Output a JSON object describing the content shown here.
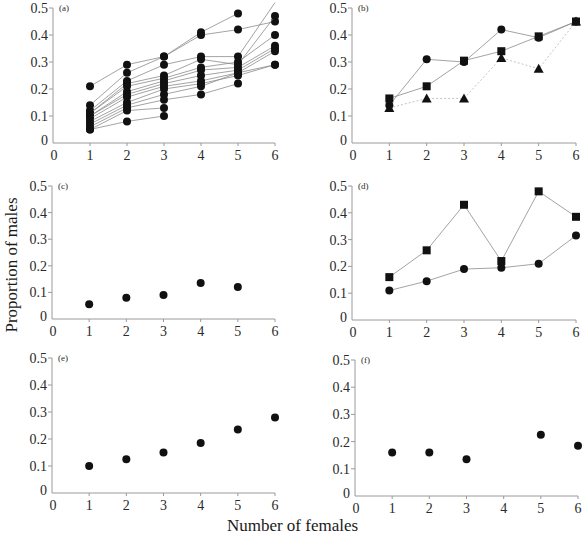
{
  "figure": {
    "ylabel": "Proportion of males",
    "xlabel": "Number of females"
  },
  "chart_data": [
    {
      "panel": "(a)",
      "type": "line",
      "xlabel": "Number of females",
      "ylabel": "Proportion of males",
      "xlim": [
        0,
        6
      ],
      "ylim": [
        0,
        0.5
      ],
      "xticks": [
        0,
        1,
        2,
        3,
        4,
        5,
        6
      ],
      "yticks": [
        0,
        0.1,
        0.2,
        0.3,
        0.4,
        0.5
      ],
      "grid": false,
      "marker": "circle",
      "x": [
        1,
        2,
        3,
        4,
        5,
        6
      ],
      "series": [
        {
          "name": "group 1",
          "values": [
            0.21,
            0.29,
            0.32,
            0.41,
            0.48,
            null
          ]
        },
        {
          "name": "group 2",
          "values": [
            0.14,
            0.26,
            0.32,
            0.4,
            0.42,
            0.45
          ]
        },
        {
          "name": "group 3",
          "values": [
            0.12,
            0.23,
            0.29,
            0.32,
            0.32,
            0.52
          ]
        },
        {
          "name": "group 4",
          "values": [
            0.11,
            0.22,
            0.25,
            0.31,
            0.29,
            0.47
          ]
        },
        {
          "name": "group 5",
          "values": [
            0.11,
            0.21,
            0.24,
            0.28,
            0.3,
            0.4
          ]
        },
        {
          "name": "group 6",
          "values": [
            0.1,
            0.19,
            0.23,
            0.27,
            0.28,
            0.36
          ]
        },
        {
          "name": "group 7",
          "values": [
            0.1,
            0.18,
            0.22,
            0.25,
            0.27,
            0.35
          ]
        },
        {
          "name": "group 8",
          "values": [
            0.09,
            0.17,
            0.21,
            0.23,
            0.26,
            0.34
          ]
        },
        {
          "name": "group 9",
          "values": [
            0.08,
            0.15,
            0.2,
            0.22,
            0.25,
            0.29
          ]
        },
        {
          "name": "group 10",
          "values": [
            0.07,
            0.14,
            0.18,
            0.21,
            0.26,
            0.29
          ]
        },
        {
          "name": "group 11",
          "values": [
            0.06,
            0.13,
            0.16,
            0.18,
            0.22,
            null
          ]
        },
        {
          "name": "group 12",
          "values": [
            0.05,
            0.12,
            0.13,
            null,
            null,
            null
          ]
        },
        {
          "name": "group 13",
          "values": [
            0.05,
            0.08,
            0.1,
            null,
            null,
            null
          ]
        }
      ]
    },
    {
      "panel": "(b)",
      "type": "line",
      "xlim": [
        0,
        6
      ],
      "ylim": [
        0,
        0.5
      ],
      "xticks": [
        0,
        1,
        2,
        3,
        4,
        5,
        6
      ],
      "yticks": [
        0,
        0.1,
        0.2,
        0.3,
        0.4,
        0.5
      ],
      "grid": false,
      "x": [
        1,
        2,
        3,
        4,
        5,
        6
      ],
      "series": [
        {
          "name": "circles",
          "marker": "circle",
          "line": "solid",
          "values": [
            0.14,
            0.31,
            0.3,
            0.42,
            0.39,
            0.45
          ]
        },
        {
          "name": "squares",
          "marker": "square",
          "line": "solid",
          "values": [
            0.165,
            0.21,
            0.305,
            0.34,
            0.395,
            0.45
          ]
        },
        {
          "name": "triangles",
          "marker": "triangle",
          "line": "dotted",
          "values": [
            0.13,
            0.165,
            0.165,
            0.315,
            0.275,
            0.45
          ]
        }
      ]
    },
    {
      "panel": "(c)",
      "type": "scatter",
      "xlim": [
        0,
        6
      ],
      "ylim": [
        0,
        0.5
      ],
      "xticks": [
        0,
        1,
        2,
        3,
        4,
        5,
        6
      ],
      "yticks": [
        0,
        0.1,
        0.2,
        0.3,
        0.4,
        0.5
      ],
      "grid": false,
      "x": [
        1,
        2,
        3,
        4,
        5
      ],
      "series": [
        {
          "name": "circles",
          "marker": "circle",
          "line": "none",
          "values": [
            0.055,
            0.08,
            0.09,
            0.135,
            0.12
          ]
        }
      ]
    },
    {
      "panel": "(d)",
      "type": "line",
      "xlim": [
        0,
        6
      ],
      "ylim": [
        0,
        0.5
      ],
      "xticks": [
        0,
        1,
        2,
        3,
        4,
        5,
        6
      ],
      "yticks": [
        0,
        0.1,
        0.2,
        0.3,
        0.4,
        0.5
      ],
      "grid": false,
      "x": [
        1,
        2,
        3,
        4,
        5,
        6
      ],
      "series": [
        {
          "name": "squares",
          "marker": "square",
          "line": "solid",
          "values": [
            0.16,
            0.26,
            0.43,
            0.22,
            0.48,
            0.385
          ]
        },
        {
          "name": "circles",
          "marker": "circle",
          "line": "solid",
          "values": [
            0.11,
            0.145,
            0.19,
            0.195,
            0.21,
            0.315
          ]
        }
      ]
    },
    {
      "panel": "(e)",
      "type": "scatter",
      "xlim": [
        0,
        6
      ],
      "ylim": [
        0,
        0.5
      ],
      "xticks": [
        0,
        1,
        2,
        3,
        4,
        5,
        6
      ],
      "yticks": [
        0,
        0.1,
        0.2,
        0.3,
        0.4,
        0.5
      ],
      "grid": false,
      "x": [
        1,
        2,
        3,
        4,
        5,
        6
      ],
      "series": [
        {
          "name": "circles",
          "marker": "circle",
          "line": "none",
          "values": [
            0.1,
            0.125,
            0.15,
            0.185,
            0.235,
            0.28
          ]
        }
      ]
    },
    {
      "panel": "(f)",
      "type": "scatter",
      "xlim": [
        0,
        6
      ],
      "ylim": [
        0,
        0.5
      ],
      "xticks": [
        0,
        1,
        2,
        3,
        4,
        5,
        6
      ],
      "yticks": [
        0,
        0.1,
        0.2,
        0.3,
        0.4,
        0.5
      ],
      "grid": false,
      "x": [
        1,
        2,
        3,
        5,
        6
      ],
      "series": [
        {
          "name": "circles",
          "marker": "circle",
          "line": "none",
          "values": [
            0.16,
            0.16,
            0.135,
            0.225,
            0.185
          ]
        }
      ]
    }
  ],
  "layout": {
    "panels": [
      {
        "x0": 53,
        "y0": 143,
        "x6": 275,
        "y05": 8
      },
      {
        "x0": 352,
        "y0": 143,
        "x6": 576,
        "y05": 8
      },
      {
        "x0": 52,
        "y0": 319,
        "x6": 275,
        "y05": 186
      },
      {
        "x0": 352,
        "y0": 320,
        "x6": 576,
        "y05": 186
      },
      {
        "x0": 52,
        "y0": 493,
        "x6": 275,
        "y05": 358
      },
      {
        "x0": 355,
        "y0": 496,
        "x6": 578,
        "y05": 360
      }
    ],
    "colors": {
      "axis": "#9a9a9a",
      "line": "#8c8c8c",
      "marker": "#111111",
      "text": "#2a2a2a"
    }
  }
}
